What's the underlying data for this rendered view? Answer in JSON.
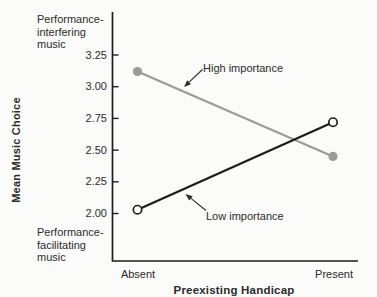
{
  "chart_data": {
    "type": "line",
    "title": "",
    "xlabel": "Preexisting Handicap",
    "ylabel": "Mean Music Choice",
    "y_end_labels": {
      "top": "Performance-\ninterfering\nmusic",
      "bottom": "Performance-\nfacilitating\nmusic"
    },
    "categories": [
      "Absent",
      "Present"
    ],
    "yticks": [
      "3.25",
      "3.00",
      "2.75",
      "2.50",
      "2.25",
      "2.00"
    ],
    "ylim": [
      2.0,
      3.25
    ],
    "grid": false,
    "legend": "inline-annotations",
    "series": [
      {
        "name": "High importance",
        "values": [
          3.12,
          2.45
        ],
        "color": "#9b9b9b",
        "marker": "filled-circle"
      },
      {
        "name": "Low importance",
        "values": [
          2.03,
          2.72
        ],
        "color": "#1d1d1d",
        "marker": "open-circle"
      }
    ],
    "colors": {
      "axis": "#1d1d1d",
      "text": "#2b2b2b",
      "background": "#fbfbf9",
      "open_marker_fill": "#ffffff"
    }
  }
}
